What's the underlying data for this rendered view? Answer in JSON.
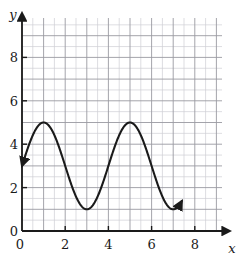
{
  "chart_data": {
    "type": "line",
    "title": "",
    "subtitle": "",
    "xlabel": "x",
    "ylabel": "y",
    "xlim": [
      0,
      9.3
    ],
    "ylim": [
      0,
      9.7
    ],
    "xticks": [
      0,
      2,
      4,
      6,
      8
    ],
    "xtick_labels": [
      "0",
      "2",
      "4",
      "6",
      "8"
    ],
    "yticks": [
      0,
      2,
      4,
      6,
      8
    ],
    "ytick_labels": [
      "0",
      "2",
      "4",
      "6",
      "8"
    ],
    "grid": true,
    "grid_minor_step": 0.5,
    "grid_major_step": 1,
    "legend": "none",
    "origin_label": "0",
    "series": [
      {
        "name": "sinusoid",
        "description": "Cosine-type wave, amplitude 2, midline 3, period 4, peaks at x=1 and x=5 with y=5, minimum at x=3 with y=1",
        "color": "#1a1a1a",
        "start_arrow": true,
        "end_arrow": true,
        "amplitude": 2,
        "midline": 3,
        "period": 4,
        "x_start": 0,
        "x_end": 7.4,
        "y_start": 2.5,
        "y_end": 1.0,
        "points": [
          {
            "x": 0.0,
            "y": 2.5
          },
          {
            "x": 0.5,
            "y": 4.0
          },
          {
            "x": 1.0,
            "y": 5.0
          },
          {
            "x": 1.5,
            "y": 4.4
          },
          {
            "x": 2.0,
            "y": 3.0
          },
          {
            "x": 2.5,
            "y": 1.6
          },
          {
            "x": 3.0,
            "y": 1.0
          },
          {
            "x": 3.5,
            "y": 1.6
          },
          {
            "x": 4.0,
            "y": 3.0
          },
          {
            "x": 4.5,
            "y": 4.4
          },
          {
            "x": 5.0,
            "y": 5.0
          },
          {
            "x": 5.5,
            "y": 4.4
          },
          {
            "x": 6.0,
            "y": 3.0
          },
          {
            "x": 6.5,
            "y": 1.6
          },
          {
            "x": 7.0,
            "y": 1.1
          },
          {
            "x": 7.4,
            "y": 1.0
          }
        ]
      }
    ],
    "colors": {
      "curve": "#1a1a1a",
      "axis": "#1a1a1a",
      "grid_minor": "#cfcfd4",
      "grid_major": "#9a9aa2",
      "background": "#ffffff"
    }
  }
}
